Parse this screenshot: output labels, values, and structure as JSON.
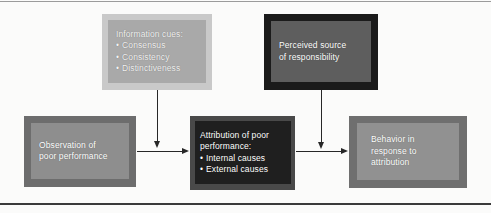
{
  "diagram": {
    "background_color": "#fbfbfa",
    "rules": {
      "top_color": "#9b9b9b",
      "bottom_color": "#3a3a3a"
    },
    "nodes": {
      "information_cues": {
        "heading": "Information cues:",
        "bullets": [
          "Consensus",
          "Consistency",
          "Distinctiveness"
        ],
        "frame_color": "#c9c9c9",
        "panel_color": "#a9a9a9",
        "text_color": "#f2f2f2"
      },
      "perceived_source": {
        "line1": "Perceived source",
        "line2": "of responsibility",
        "frame_color": "#1b1b1b",
        "panel_color": "#5e5e5e",
        "text_color": "#ffffff"
      },
      "observation": {
        "line1": "Observation of",
        "line2": "poor performance",
        "frame_color": "#6d6d6d",
        "panel_color": "#8e8e8e",
        "text_color": "#ffffff"
      },
      "attribution": {
        "line1": "Attribution of poor",
        "line2": "performance:",
        "bullets": [
          "Internal causes",
          "External causes"
        ],
        "frame_color": "#494949",
        "panel_color": "#1f1f1f",
        "text_color": "#ffffff"
      },
      "behavior": {
        "line1": "Behavior in",
        "line2": "response to",
        "line3": "attribution",
        "frame_color": "#6f6f6f",
        "panel_color": "#919191",
        "text_color": "#ffffff"
      }
    },
    "connectors": [
      {
        "name": "information-cues-to-attribution",
        "direction": "down",
        "color": "#272727"
      },
      {
        "name": "perceived-source-to-behavior",
        "direction": "down",
        "color": "#272727"
      },
      {
        "name": "observation-to-attribution",
        "direction": "right",
        "color": "#272727"
      },
      {
        "name": "attribution-to-behavior",
        "direction": "right",
        "color": "#272727"
      }
    ]
  }
}
